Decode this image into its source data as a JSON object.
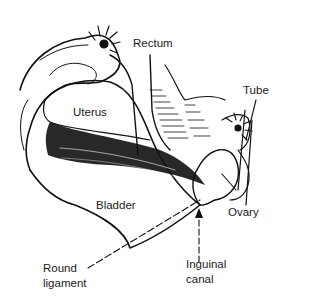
{
  "figure": {
    "type": "anatomical line illustration",
    "labels": {
      "rectum": "Rectum",
      "tube": "Tube",
      "uterus": "Uterus",
      "bladder": "Bladder",
      "ovary": "Ovary",
      "round_ligament_1": "Round",
      "round_ligament_2": "ligament",
      "inguinal_canal_1": "Inguinal",
      "inguinal_canal_2": "canal"
    },
    "colors": {
      "ink": "#111111",
      "background": "#ffffff"
    }
  }
}
